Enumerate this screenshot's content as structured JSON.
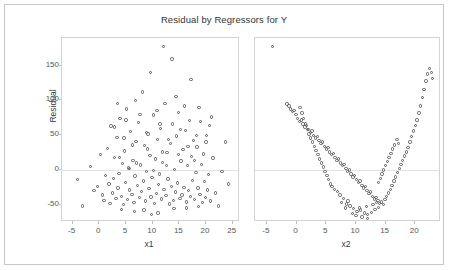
{
  "chart_title": "Residual by Regressors for Y",
  "axes": {
    "y_label": "Residual",
    "y_ticks": [
      "150",
      "100",
      "50",
      "0",
      "-50"
    ],
    "panel1_x_label": "x1",
    "panel1_x_ticks": [
      "-5",
      "0",
      "5",
      "10",
      "15",
      "20",
      "25"
    ],
    "panel2_x_label": "x2",
    "panel2_x_ticks": [
      "-5",
      "0",
      "5",
      "10",
      "15",
      "20"
    ]
  },
  "colors": {
    "marker_stroke": "#5a5a5a",
    "panel_border": "#d3d3d3",
    "frame_border": "#c9c9c9",
    "zero_line": "#e2e2e2",
    "text": "#3a3a3a"
  },
  "chart_data": {
    "type": "scatter",
    "title": "Residual by Regressors for Y",
    "ylabel": "Residual",
    "ylim": [
      -75,
      190
    ],
    "y_ticks": [
      150,
      100,
      50,
      0,
      -50
    ],
    "grid": false,
    "legend": "none",
    "reference_line": {
      "y": 0,
      "style": "solid-faint"
    },
    "panels": [
      {
        "name": "panel-x1",
        "xlabel": "x1",
        "xlim": [
          -7,
          26
        ],
        "x_ticks": [
          -5,
          0,
          5,
          10,
          15,
          20,
          25
        ],
        "pattern": "unstructured random scatter, no trend",
        "points": [
          [
            -4.1,
            -14
          ],
          [
            -3.2,
            -52
          ],
          [
            -1.6,
            5
          ],
          [
            -1.0,
            -30
          ],
          [
            -0.4,
            -24
          ],
          [
            0.2,
            22
          ],
          [
            0.6,
            -36
          ],
          [
            0.9,
            -44
          ],
          [
            1.2,
            -8
          ],
          [
            1.5,
            31
          ],
          [
            1.8,
            -20
          ],
          [
            2.0,
            -48
          ],
          [
            2.2,
            63
          ],
          [
            2.5,
            -33
          ],
          [
            2.7,
            -12
          ],
          [
            2.9,
            18
          ],
          [
            3.1,
            -41
          ],
          [
            3.3,
            47
          ],
          [
            3.5,
            -26
          ],
          [
            3.7,
            -5
          ],
          [
            3.9,
            74
          ],
          [
            4.1,
            -38
          ],
          [
            4.3,
            9
          ],
          [
            4.5,
            -50
          ],
          [
            4.7,
            27
          ],
          [
            4.9,
            -18
          ],
          [
            5.1,
            88
          ],
          [
            5.3,
            -43
          ],
          [
            5.5,
            3
          ],
          [
            5.7,
            -29
          ],
          [
            5.9,
            55
          ],
          [
            6.1,
            -35
          ],
          [
            6.3,
            14
          ],
          [
            6.5,
            -47
          ],
          [
            6.7,
            -9
          ],
          [
            6.9,
            41
          ],
          [
            7.1,
            -22
          ],
          [
            7.3,
            68
          ],
          [
            7.5,
            -40
          ],
          [
            7.7,
            7
          ],
          [
            7.9,
            -31
          ],
          [
            8.1,
            112
          ],
          [
            8.3,
            -16
          ],
          [
            8.5,
            35
          ],
          [
            8.7,
            -45
          ],
          [
            8.9,
            -2
          ],
          [
            9.1,
            52
          ],
          [
            9.3,
            -27
          ],
          [
            9.5,
            21
          ],
          [
            9.7,
            -39
          ],
          [
            9.9,
            -11
          ],
          [
            10.1,
            79
          ],
          [
            10.3,
            -48
          ],
          [
            10.5,
            16
          ],
          [
            10.7,
            -34
          ],
          [
            10.9,
            44
          ],
          [
            11.1,
            -21
          ],
          [
            11.3,
            -6
          ],
          [
            11.5,
            60
          ],
          [
            11.7,
            -42
          ],
          [
            11.9,
            11
          ],
          [
            12.1,
            -28
          ],
          [
            12.3,
            96
          ],
          [
            12.5,
            -37
          ],
          [
            12.7,
            25
          ],
          [
            12.9,
            -13
          ],
          [
            13.1,
            -49
          ],
          [
            13.3,
            38
          ],
          [
            13.5,
            -24
          ],
          [
            13.7,
            66
          ],
          [
            13.9,
            -44
          ],
          [
            14.1,
            1
          ],
          [
            14.3,
            -32
          ],
          [
            14.5,
            49
          ],
          [
            14.7,
            -19
          ],
          [
            14.9,
            83
          ],
          [
            15.1,
            -41
          ],
          [
            15.3,
            13
          ],
          [
            15.5,
            -36
          ],
          [
            15.7,
            29
          ],
          [
            15.9,
            -25
          ],
          [
            16.1,
            57
          ],
          [
            16.3,
            -46
          ],
          [
            16.5,
            6
          ],
          [
            16.7,
            -30
          ],
          [
            16.9,
            71
          ],
          [
            17.1,
            -38
          ],
          [
            17.3,
            19
          ],
          [
            17.5,
            -15
          ],
          [
            17.7,
            42
          ],
          [
            17.9,
            -43
          ],
          [
            18.1,
            -4
          ],
          [
            18.3,
            33
          ],
          [
            18.5,
            -26
          ],
          [
            18.7,
            90
          ],
          [
            18.9,
            -35
          ],
          [
            19.1,
            8
          ],
          [
            19.3,
            -47
          ],
          [
            19.5,
            23
          ],
          [
            19.7,
            -17
          ],
          [
            19.9,
            -40
          ],
          [
            20.1,
            50
          ],
          [
            20.3,
            -29
          ],
          [
            20.5,
            -7
          ],
          [
            20.7,
            64
          ],
          [
            20.9,
            -45
          ],
          [
            21.3,
            17
          ],
          [
            21.8,
            -33
          ],
          [
            22.4,
            -52
          ],
          [
            23.0,
            -2
          ],
          [
            23.6,
            40
          ],
          [
            24.2,
            -20
          ],
          [
            12.0,
            178
          ],
          [
            13.6,
            160
          ],
          [
            9.6,
            140
          ],
          [
            17.2,
            130
          ],
          [
            14.4,
            106
          ],
          [
            6.8,
            100
          ],
          [
            3.4,
            96
          ],
          [
            16.0,
            92
          ],
          [
            10.8,
            86
          ],
          [
            7.6,
            80
          ],
          [
            21.0,
            76
          ],
          [
            5.0,
            72
          ],
          [
            19.0,
            70
          ],
          [
            11.4,
            66
          ],
          [
            2.8,
            62
          ],
          [
            15.2,
            58
          ],
          [
            8.8,
            54
          ],
          [
            18.2,
            50
          ],
          [
            4.6,
            46
          ],
          [
            13.0,
            44
          ],
          [
            20.0,
            40
          ],
          [
            6.2,
            36
          ],
          [
            16.6,
            34
          ],
          [
            9.0,
            30
          ],
          [
            11.8,
            26
          ],
          [
            14.8,
            22
          ],
          [
            3.8,
            18
          ],
          [
            17.8,
            14
          ],
          [
            7.0,
            10
          ],
          [
            12.6,
            6
          ],
          [
            5.6,
            2
          ],
          [
            10.2,
            -1
          ],
          [
            8.4,
            -58
          ],
          [
            11.0,
            -62
          ],
          [
            14.0,
            -56
          ],
          [
            6.6,
            -60
          ],
          [
            16.4,
            -55
          ],
          [
            9.8,
            -64
          ],
          [
            4.2,
            -57
          ],
          [
            18.6,
            -53
          ]
        ]
      },
      {
        "name": "panel-x2",
        "xlabel": "x2",
        "xlim": [
          -7,
          24
        ],
        "x_ticks": [
          -5,
          0,
          5,
          10,
          15,
          20
        ],
        "pattern": "clear U-shaped quadratic curvature indicating missing squared term in x2",
        "points": [
          [
            -4.0,
            178
          ],
          [
            -1.6,
            95
          ],
          [
            -1.3,
            92
          ],
          [
            -1.0,
            88
          ],
          [
            -0.7,
            84
          ],
          [
            -0.4,
            86
          ],
          [
            -0.1,
            80
          ],
          [
            0.2,
            74
          ],
          [
            0.5,
            70
          ],
          [
            0.8,
            72
          ],
          [
            1.1,
            66
          ],
          [
            1.4,
            62
          ],
          [
            1.7,
            64
          ],
          [
            2.0,
            58
          ],
          [
            2.3,
            54
          ],
          [
            2.6,
            56
          ],
          [
            2.9,
            50
          ],
          [
            3.2,
            46
          ],
          [
            3.5,
            48
          ],
          [
            3.8,
            42
          ],
          [
            4.1,
            38
          ],
          [
            4.4,
            40
          ],
          [
            4.7,
            34
          ],
          [
            5.0,
            30
          ],
          [
            5.3,
            32
          ],
          [
            5.6,
            26
          ],
          [
            5.9,
            22
          ],
          [
            6.2,
            24
          ],
          [
            6.5,
            18
          ],
          [
            6.8,
            14
          ],
          [
            7.1,
            16
          ],
          [
            7.4,
            10
          ],
          [
            7.7,
            6
          ],
          [
            8.0,
            8
          ],
          [
            8.3,
            2
          ],
          [
            8.6,
            -2
          ],
          [
            8.9,
            0
          ],
          [
            9.2,
            -6
          ],
          [
            9.5,
            -10
          ],
          [
            9.8,
            -8
          ],
          [
            10.1,
            -14
          ],
          [
            10.4,
            -18
          ],
          [
            10.7,
            -16
          ],
          [
            11.0,
            -22
          ],
          [
            11.3,
            -26
          ],
          [
            11.6,
            -24
          ],
          [
            11.9,
            -30
          ],
          [
            12.2,
            -34
          ],
          [
            12.5,
            -32
          ],
          [
            12.8,
            -38
          ],
          [
            13.1,
            -42
          ],
          [
            13.4,
            -40
          ],
          [
            13.7,
            -44
          ],
          [
            14.0,
            -48
          ],
          [
            14.3,
            -46
          ],
          [
            14.6,
            -50
          ],
          [
            9.0,
            -52
          ],
          [
            9.6,
            -56
          ],
          [
            10.2,
            -60
          ],
          [
            10.8,
            -58
          ],
          [
            11.4,
            -62
          ],
          [
            12.0,
            -64
          ],
          [
            12.6,
            -61
          ],
          [
            13.2,
            -57
          ],
          [
            13.8,
            -54
          ],
          [
            8.4,
            -49
          ],
          [
            8.7,
            -45
          ],
          [
            7.9,
            -41
          ],
          [
            7.3,
            -36
          ],
          [
            6.9,
            -31
          ],
          [
            14.9,
            -43
          ],
          [
            15.2,
            -38
          ],
          [
            15.5,
            -33
          ],
          [
            15.8,
            -28
          ],
          [
            16.1,
            -22
          ],
          [
            16.4,
            -16
          ],
          [
            16.7,
            -10
          ],
          [
            17.0,
            -4
          ],
          [
            17.3,
            2
          ],
          [
            17.6,
            8
          ],
          [
            17.9,
            14
          ],
          [
            18.2,
            20
          ],
          [
            18.5,
            26
          ],
          [
            18.8,
            32
          ],
          [
            19.1,
            40
          ],
          [
            19.4,
            48
          ],
          [
            19.7,
            56
          ],
          [
            20.0,
            64
          ],
          [
            20.3,
            72
          ],
          [
            20.6,
            82
          ],
          [
            20.9,
            92
          ],
          [
            21.2,
            104
          ],
          [
            21.5,
            116
          ],
          [
            21.8,
            128
          ],
          [
            22.1,
            138
          ],
          [
            22.4,
            146
          ],
          [
            22.7,
            140
          ],
          [
            22.9,
            132
          ],
          [
            16.9,
            44
          ],
          [
            17.2,
            38
          ],
          [
            16.5,
            36
          ],
          [
            16.2,
            30
          ],
          [
            15.9,
            24
          ],
          [
            15.6,
            18
          ],
          [
            15.3,
            12
          ],
          [
            15.0,
            6
          ],
          [
            14.7,
            0
          ],
          [
            14.4,
            -6
          ],
          [
            14.1,
            -12
          ],
          [
            13.8,
            -18
          ],
          [
            6.4,
            -28
          ],
          [
            6.0,
            -24
          ],
          [
            5.7,
            -20
          ],
          [
            5.4,
            -14
          ],
          [
            5.1,
            -8
          ],
          [
            4.8,
            -2
          ],
          [
            4.5,
            4
          ],
          [
            4.2,
            10
          ],
          [
            3.9,
            16
          ],
          [
            3.6,
            22
          ],
          [
            3.3,
            28
          ],
          [
            3.0,
            34
          ],
          [
            2.7,
            40
          ],
          [
            2.4,
            46
          ],
          [
            2.1,
            52
          ],
          [
            1.8,
            58
          ],
          [
            1.5,
            66
          ],
          [
            1.2,
            74
          ],
          [
            0.9,
            82
          ],
          [
            0.6,
            90
          ],
          [
            10.0,
            -66
          ],
          [
            11.0,
            -68
          ],
          [
            12.0,
            -70
          ],
          [
            9.4,
            -63
          ],
          [
            10.6,
            -55
          ],
          [
            11.8,
            -53
          ],
          [
            12.9,
            -50
          ],
          [
            8.2,
            -55
          ],
          [
            13.5,
            -47
          ],
          [
            7.6,
            -47
          ]
        ]
      }
    ]
  }
}
